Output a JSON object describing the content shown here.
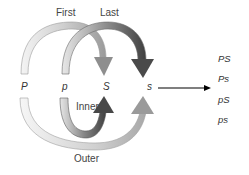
{
  "labels": {
    "first": "First",
    "last": "Last",
    "inner": "Inner",
    "outer": "Outer"
  },
  "alleles": [
    "P",
    "p",
    "S",
    "s"
  ],
  "combinations": [
    "PS",
    "Ps",
    "pS",
    "ps"
  ],
  "colors": {
    "first_arrow": "#b8b8b8",
    "last_arrow": "#555555",
    "inner_arrow": "#555555",
    "outer_arrow": "#b0b0b0",
    "result_arrow": "#000000"
  }
}
